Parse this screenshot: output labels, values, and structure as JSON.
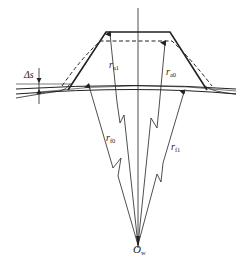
{
  "diagram": {
    "type": "gear-tooth-geometry",
    "colors": {
      "line": "#222222",
      "background": "#ffffff"
    },
    "labels": {
      "r_a1": {
        "base": "r",
        "sub": "a1"
      },
      "r_a0": {
        "base": "r",
        "sub": "a0"
      },
      "r_f0": {
        "base": "r",
        "sub": "f0"
      },
      "r_f1": {
        "base": "r",
        "sub": "f1"
      },
      "delta_s": {
        "base": "Δs"
      },
      "center": {
        "base": "O",
        "sub": "w"
      }
    }
  }
}
